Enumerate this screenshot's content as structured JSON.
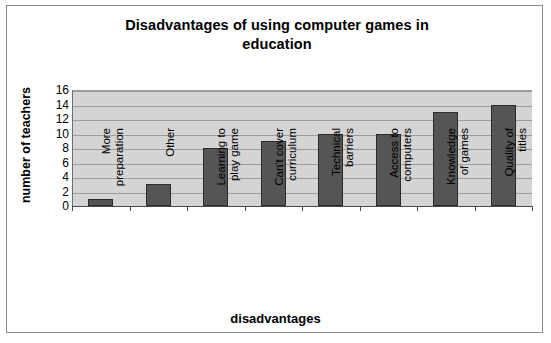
{
  "chart_data": {
    "type": "bar",
    "title": "Disadvantages of using computer games in education",
    "title_line1": "Disadvantages of using computer games in",
    "title_line2": "education",
    "xlabel": "disadvantages",
    "ylabel": "number of teachers",
    "ylim": [
      0,
      16
    ],
    "ytick_step": 2,
    "yticks": [
      16,
      14,
      12,
      10,
      8,
      6,
      4,
      2,
      0
    ],
    "grid": true,
    "legend": false,
    "bar_color": "#555555",
    "bar_border_color": "#2b2b2b",
    "plot_background": "#d4d4d4",
    "categories": [
      "More preparation",
      "Other",
      "Learning to play game",
      "Can't cover curriculum",
      "Technical barriers",
      "Access to computers",
      "Knowledge of games",
      "Quality of titles"
    ],
    "category_lines": [
      [
        "More",
        "preparation"
      ],
      [
        "Other"
      ],
      [
        "Learning to",
        "play game"
      ],
      [
        "Can't cover",
        "curriculum"
      ],
      [
        "Technical",
        "barriers"
      ],
      [
        "Access to",
        "computers"
      ],
      [
        "Knowledge",
        "of games"
      ],
      [
        "Quality of",
        "titles"
      ]
    ],
    "values": [
      1,
      3,
      8,
      9,
      10,
      10,
      13,
      14
    ]
  }
}
